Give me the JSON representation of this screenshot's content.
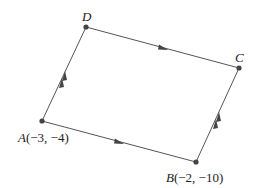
{
  "diagram": {
    "type": "parallelogram",
    "line_color": "#555555",
    "point_color": "#444444",
    "points": {
      "A": {
        "label": "A",
        "coords": "(−3, −4)"
      },
      "B": {
        "label": "B",
        "coords": "(−2, −10)"
      },
      "C": {
        "label": "C",
        "coords": ""
      },
      "D": {
        "label": "D",
        "coords": ""
      }
    },
    "edges": [
      {
        "from": "A",
        "to": "B",
        "arrows": 1
      },
      {
        "from": "D",
        "to": "C",
        "arrows": 1
      },
      {
        "from": "A",
        "to": "D",
        "arrows": 2
      },
      {
        "from": "B",
        "to": "C",
        "arrows": 2
      }
    ]
  }
}
